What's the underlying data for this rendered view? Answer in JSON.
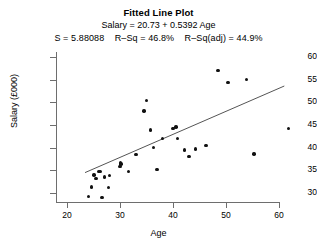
{
  "chart_data": {
    "type": "scatter",
    "title": "Fitted Line Plot",
    "subtitle_equation": "Salary = 20.73 + 0.5392 Age",
    "subtitle_stats": "S = 5.88088    R–Sq = 46.8%    R–Sq(adj) = 44.9%",
    "stats": {
      "S": "5.88088",
      "R_Sq": "46.8%",
      "R_Sq_adj": "44.9%",
      "intercept": 20.73,
      "slope": 0.5392
    },
    "xlabel": "Age",
    "ylabel": "Salary (£000)",
    "xlim": [
      22,
      63
    ],
    "ylim": [
      28,
      61
    ],
    "xticks": [
      20,
      30,
      40,
      50,
      60
    ],
    "yticks": [
      30,
      35,
      40,
      45,
      50,
      55,
      60
    ],
    "grid": false,
    "legend": "none",
    "series": [
      {
        "name": "Salary vs Age",
        "marker": "filled-circle",
        "color": "#111111",
        "points": [
          [
            24.0,
            29.2
          ],
          [
            24.6,
            31.3
          ],
          [
            25.1,
            34.0
          ],
          [
            25.5,
            33.2
          ],
          [
            25.9,
            34.7
          ],
          [
            26.2,
            34.8
          ],
          [
            26.6,
            29.0
          ],
          [
            27.1,
            33.5
          ],
          [
            27.8,
            31.2
          ],
          [
            28.0,
            33.9
          ],
          [
            30.0,
            35.9
          ],
          [
            30.1,
            36.6
          ],
          [
            30.2,
            36.4
          ],
          [
            31.6,
            34.7
          ],
          [
            33.0,
            38.5
          ],
          [
            34.5,
            48.1
          ],
          [
            35.0,
            50.4
          ],
          [
            35.7,
            43.9
          ],
          [
            36.3,
            40.0
          ],
          [
            37.0,
            35.2
          ],
          [
            38.0,
            42.0
          ],
          [
            40.0,
            44.2
          ],
          [
            40.6,
            44.6
          ],
          [
            40.8,
            42.0
          ],
          [
            42.2,
            39.5
          ],
          [
            43.0,
            38.0
          ],
          [
            44.3,
            39.7
          ],
          [
            46.2,
            40.5
          ],
          [
            48.5,
            57.0
          ],
          [
            50.4,
            54.4
          ],
          [
            53.9,
            55.0
          ],
          [
            55.3,
            38.6
          ],
          [
            61.8,
            44.2
          ]
        ]
      }
    ],
    "fit_line": {
      "name": "Regression line",
      "color": "#555555",
      "x_start": 23.4,
      "y_start": 34.5,
      "x_end": 61.0,
      "y_end": 53.6
    }
  },
  "axis": {
    "y_tick_labels": [
      "60",
      "55",
      "50",
      "45",
      "40",
      "35",
      "30"
    ],
    "x_tick_labels": [
      "20",
      "30",
      "40",
      "50",
      "60"
    ]
  }
}
